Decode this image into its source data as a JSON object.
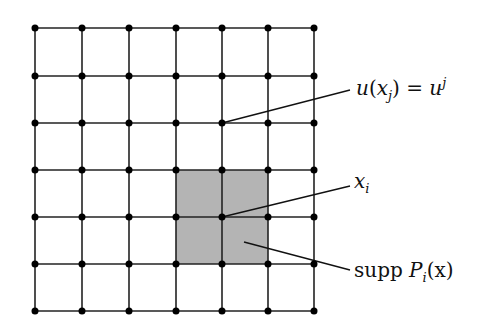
{
  "diagram": {
    "type": "finite-element-grid",
    "grid": {
      "columns_x": [
        35,
        82,
        129,
        176,
        222,
        268,
        314
      ],
      "rows_y": [
        28,
        76,
        123,
        170,
        217,
        264,
        311
      ],
      "node_radius": 3.5,
      "line_color": "#222222",
      "node_color": "#000000"
    },
    "support_region": {
      "x": 176,
      "y": 170,
      "width": 92,
      "height": 94,
      "fill": "#b4b4b4"
    },
    "labels": {
      "node_value": {
        "u": "u",
        "open": "(",
        "x": "x",
        "sub_j": "j",
        "close": ")",
        "eq": " = ",
        "u2": "u",
        "sup_j": "j"
      },
      "node_xi": {
        "x": "x",
        "sub_i": "i"
      },
      "support": {
        "supp": "supp ",
        "P": "P",
        "sub_i": "i",
        "arg": "(x)"
      }
    },
    "leaders": [
      {
        "name": "node-value-leader",
        "x1": 222,
        "y1": 123,
        "x2": 350,
        "y2": 90
      },
      {
        "name": "xi-leader",
        "x1": 222,
        "y1": 217,
        "x2": 350,
        "y2": 186
      },
      {
        "name": "support-leader",
        "x1": 244,
        "y1": 242,
        "x2": 350,
        "y2": 270
      }
    ]
  }
}
